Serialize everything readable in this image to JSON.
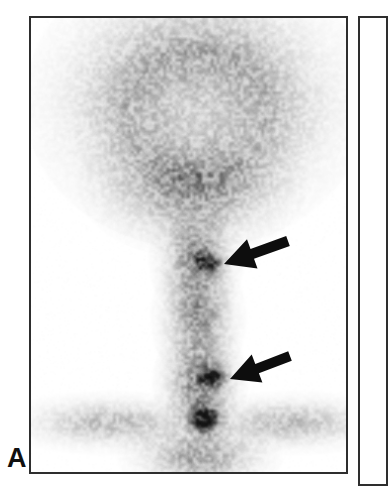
{
  "figure": {
    "kind": "nuclear-medicine-scintigram",
    "modality_caption": "",
    "background_color": "#ffffff"
  },
  "panels": [
    {
      "id": "A",
      "label": "A",
      "border_color": "#2e2e2e",
      "background_color": "#ffffff",
      "bounds": {
        "x": 29,
        "y": 16,
        "width": 319,
        "height": 458
      },
      "image": {
        "view": "posterior planar scintigram",
        "anatomy": "skull and cervical spine",
        "tone_light": "#f7f7f7",
        "tone_mid": "#c9c9c9",
        "tone_dark": "#8e8e8e",
        "tone_focal": "#5a5a5a"
      },
      "annotations": [
        {
          "type": "arrow",
          "name": "upper-arrow",
          "points_to": "upper cervical focal uptake",
          "tip": {
            "x": 222,
            "y": 262
          },
          "tail": {
            "x": 286,
            "y": 239
          },
          "color": "#0d0d0d"
        },
        {
          "type": "arrow",
          "name": "lower-arrow",
          "points_to": "lower cervical focal uptake",
          "tip": {
            "x": 228,
            "y": 377
          },
          "tail": {
            "x": 288,
            "y": 354
          },
          "color": "#0d0d0d"
        }
      ]
    },
    {
      "id": "B",
      "label": "",
      "border_color": "#2e2e2e",
      "background_color": "#ffffff",
      "bounds": {
        "x": 358,
        "y": 16,
        "width": 30,
        "height": 470
      }
    }
  ],
  "chart_data": {
    "type": "heatmap",
    "title": "",
    "xlabel": "",
    "ylabel": "",
    "colormap": "grayscale-inverted",
    "regions": [
      {
        "name": "calvarium-rim",
        "cx": 196,
        "cy": 100,
        "rx": 108,
        "ry": 92,
        "intensity": 0.46
      },
      {
        "name": "calvarium-interior",
        "cx": 196,
        "cy": 112,
        "rx": 80,
        "ry": 70,
        "intensity": 0.16
      },
      {
        "name": "facial-skeleton",
        "cx": 192,
        "cy": 185,
        "rx": 72,
        "ry": 45,
        "intensity": 0.3
      },
      {
        "name": "cervical-spine-upper",
        "cx": 196,
        "cy": 258,
        "rx": 30,
        "ry": 40,
        "intensity": 0.42
      },
      {
        "name": "cervical-spine-mid",
        "cx": 198,
        "cy": 318,
        "rx": 30,
        "ry": 42,
        "intensity": 0.4
      },
      {
        "name": "cervical-spine-lower",
        "cx": 200,
        "cy": 385,
        "rx": 30,
        "ry": 40,
        "intensity": 0.48
      },
      {
        "name": "focal-lesion-upper",
        "cx": 208,
        "cy": 262,
        "rx": 14,
        "ry": 11,
        "intensity": 0.62
      },
      {
        "name": "focal-lesion-lower",
        "cx": 212,
        "cy": 377,
        "rx": 13,
        "ry": 10,
        "intensity": 0.64
      },
      {
        "name": "cervicothoracic-junction",
        "cx": 204,
        "cy": 420,
        "rx": 16,
        "ry": 14,
        "intensity": 0.78
      },
      {
        "name": "shoulder-girdle-left",
        "cx": 110,
        "cy": 424,
        "rx": 72,
        "ry": 20,
        "intensity": 0.26
      },
      {
        "name": "shoulder-girdle-right",
        "cx": 292,
        "cy": 424,
        "rx": 70,
        "ry": 20,
        "intensity": 0.26
      },
      {
        "name": "upper-thorax",
        "cx": 200,
        "cy": 458,
        "rx": 52,
        "ry": 26,
        "intensity": 0.36
      }
    ],
    "focal_findings": [
      {
        "label": "upper cervical focus",
        "x": 208,
        "y": 262,
        "marked_by": "upper-arrow"
      },
      {
        "label": "lower cervical focus",
        "x": 212,
        "y": 377,
        "marked_by": "lower-arrow"
      }
    ]
  }
}
